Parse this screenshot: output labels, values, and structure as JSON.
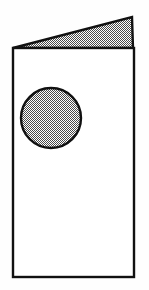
{
  "figure": {
    "canvas": {
      "width": 149,
      "height": 290
    },
    "background_color": "#fefefe",
    "stroke_color": "#111111",
    "fill_pattern_color": "#9a9a9a",
    "fill_pattern_name": "checkerboard-dither-50",
    "panel_fill_color": "#ffffff",
    "stroke_width": 2.4,
    "shapes": [
      {
        "name": "back-panel-flap",
        "type": "triangle",
        "fill": "pattern",
        "points": "13,48 132,17 133,48"
      },
      {
        "name": "front-panel",
        "type": "rectangle",
        "fill": "white",
        "x": 13,
        "y": 48,
        "width": 121,
        "height": 229
      },
      {
        "name": "circle-cutout",
        "type": "circle",
        "fill": "pattern",
        "cx": 51,
        "cy": 118,
        "r": 30
      }
    ]
  }
}
